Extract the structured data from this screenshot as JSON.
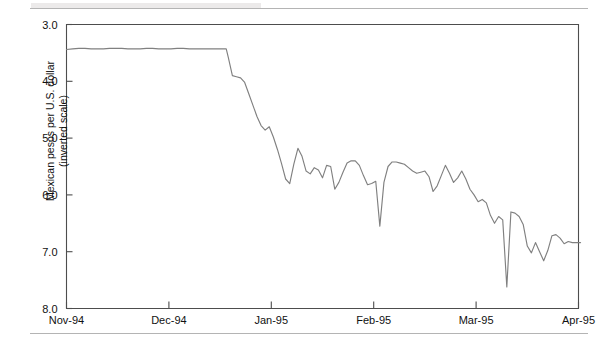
{
  "figure": {
    "background_color": "#ffffff",
    "rule_color": "#b4b4b4",
    "axis_color": "#4d4d4d",
    "line_color": "#808080"
  },
  "chart_data": {
    "type": "line",
    "title": "",
    "subtitle": "",
    "xlabel": "",
    "ylabel": "Mexican pesos per U.S. dollar\n(inverted scale)",
    "ylabel_line1": "Mexican pesos per U.S. dollar",
    "ylabel_line2": "(inverted scale)",
    "inverted_yaxis": true,
    "grid": false,
    "legend": null,
    "legend_position": "none",
    "xlim": [
      0,
      5
    ],
    "ylim": [
      3.0,
      8.0
    ],
    "ytick_labels": [
      "3.0",
      "4.0",
      "5.0",
      "6.0",
      "7.0",
      "8.0"
    ],
    "ytick_values": [
      3.0,
      4.0,
      5.0,
      6.0,
      7.0,
      8.0
    ],
    "xtick_labels": [
      "Nov-94",
      "Dec-94",
      "Jan-95",
      "Feb-95",
      "Mar-95",
      "Apr-95"
    ],
    "xtick_values": [
      0,
      1,
      2,
      3,
      4,
      5
    ],
    "series": [
      {
        "name": "Mexican peso / U.S. dollar exchange rate",
        "color": "#808080",
        "x": [
          0.0,
          0.06,
          0.12,
          0.18,
          0.24,
          0.3,
          0.36,
          0.42,
          0.48,
          0.54,
          0.6,
          0.66,
          0.72,
          0.78,
          0.84,
          0.9,
          0.96,
          1.02,
          1.08,
          1.14,
          1.2,
          1.26,
          1.32,
          1.38,
          1.44,
          1.5,
          1.56,
          1.58,
          1.62,
          1.66,
          1.7,
          1.74,
          1.78,
          1.82,
          1.86,
          1.9,
          1.94,
          1.98,
          2.02,
          2.06,
          2.1,
          2.14,
          2.18,
          2.22,
          2.26,
          2.3,
          2.34,
          2.38,
          2.42,
          2.46,
          2.5,
          2.54,
          2.58,
          2.62,
          2.66,
          2.7,
          2.74,
          2.78,
          2.82,
          2.86,
          2.9,
          2.94,
          2.98,
          3.02,
          3.06,
          3.1,
          3.14,
          3.18,
          3.22,
          3.26,
          3.3,
          3.34,
          3.38,
          3.42,
          3.46,
          3.5,
          3.54,
          3.58,
          3.62,
          3.66,
          3.7,
          3.74,
          3.78,
          3.82,
          3.86,
          3.9,
          3.94,
          3.98,
          4.02,
          4.06,
          4.1,
          4.14,
          4.18,
          4.22,
          4.26,
          4.3,
          4.34,
          4.38,
          4.42,
          4.46,
          4.5,
          4.54,
          4.58,
          4.62,
          4.66,
          4.7,
          4.74,
          4.78,
          4.82,
          4.86,
          4.9,
          4.94,
          4.98,
          5.02
        ],
        "y": [
          3.44,
          3.43,
          3.42,
          3.42,
          3.43,
          3.43,
          3.43,
          3.42,
          3.42,
          3.42,
          3.43,
          3.43,
          3.43,
          3.42,
          3.42,
          3.43,
          3.43,
          3.43,
          3.42,
          3.42,
          3.43,
          3.43,
          3.43,
          3.43,
          3.43,
          3.43,
          3.43,
          3.58,
          3.9,
          3.92,
          3.94,
          4.02,
          4.22,
          4.42,
          4.62,
          4.78,
          4.86,
          4.8,
          4.98,
          5.2,
          5.45,
          5.72,
          5.8,
          5.46,
          5.18,
          5.32,
          5.58,
          5.63,
          5.52,
          5.56,
          5.7,
          5.48,
          5.5,
          5.9,
          5.78,
          5.6,
          5.44,
          5.4,
          5.4,
          5.48,
          5.66,
          5.82,
          5.8,
          5.76,
          6.55,
          5.78,
          5.5,
          5.42,
          5.42,
          5.44,
          5.46,
          5.52,
          5.58,
          5.62,
          5.6,
          5.58,
          5.68,
          5.94,
          5.84,
          5.66,
          5.48,
          5.62,
          5.78,
          5.7,
          5.58,
          5.72,
          5.9,
          6.0,
          6.12,
          6.08,
          6.14,
          6.36,
          6.5,
          6.38,
          6.44,
          7.62,
          6.3,
          6.32,
          6.38,
          6.52,
          6.9,
          7.02,
          6.84,
          7.0,
          7.16,
          6.98,
          6.72,
          6.7,
          6.76,
          6.86,
          6.82,
          6.84,
          6.84,
          6.84
        ]
      }
    ]
  }
}
